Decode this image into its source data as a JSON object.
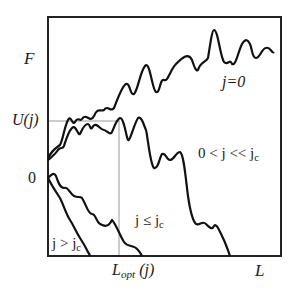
{
  "diagram": {
    "type": "line-sketch",
    "axes": {
      "y_labels": {
        "top": "F",
        "mid": "U(j)",
        "zero": "0"
      },
      "x_labels": {
        "mid": "L",
        "mid_sub": "opt",
        "mid_arg": " (j)",
        "end": "L"
      }
    },
    "curves": [
      {
        "id": "j0",
        "label": "j=0"
      },
      {
        "id": "small",
        "label": "0 < j << j",
        "sub": "c"
      },
      {
        "id": "le",
        "label": "j ≤ j",
        "sub": "c"
      },
      {
        "id": "gt",
        "label": "j > j",
        "sub": "c"
      }
    ],
    "colors": {
      "frame": "#222222",
      "curve": "#111111",
      "guide": "#9a9a9a"
    }
  }
}
